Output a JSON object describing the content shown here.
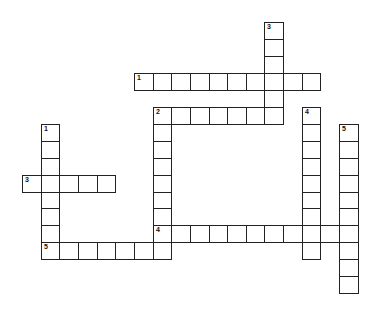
{
  "grid": {
    "origin_x": 22,
    "origin_y": 22,
    "cell_w": 18.65,
    "cell_h": 16.95,
    "line_color": "#222222"
  },
  "entries": [
    {
      "number": "1",
      "direction": "across",
      "row": 3,
      "col": 6,
      "length": 10
    },
    {
      "number": "2",
      "direction": "across",
      "row": 5,
      "col": 7,
      "length": 7
    },
    {
      "number": "3",
      "direction": "across",
      "row": 9,
      "col": 0,
      "length": 5
    },
    {
      "number": "4",
      "direction": "across",
      "row": 12,
      "col": 7,
      "length": 11
    },
    {
      "number": "5",
      "direction": "across",
      "row": 13,
      "col": 1,
      "length": 7
    },
    {
      "number": "1",
      "direction": "down",
      "row": 6,
      "col": 1,
      "length": 8
    },
    {
      "number": "2",
      "direction": "down",
      "row": 5,
      "col": 7,
      "length": 9
    },
    {
      "number": "3",
      "direction": "down",
      "row": 0,
      "col": 13,
      "length": 6
    },
    {
      "number": "4",
      "direction": "down",
      "row": 5,
      "col": 15,
      "length": 9
    },
    {
      "number": "5",
      "direction": "down",
      "row": 6,
      "col": 17,
      "length": 10
    }
  ]
}
